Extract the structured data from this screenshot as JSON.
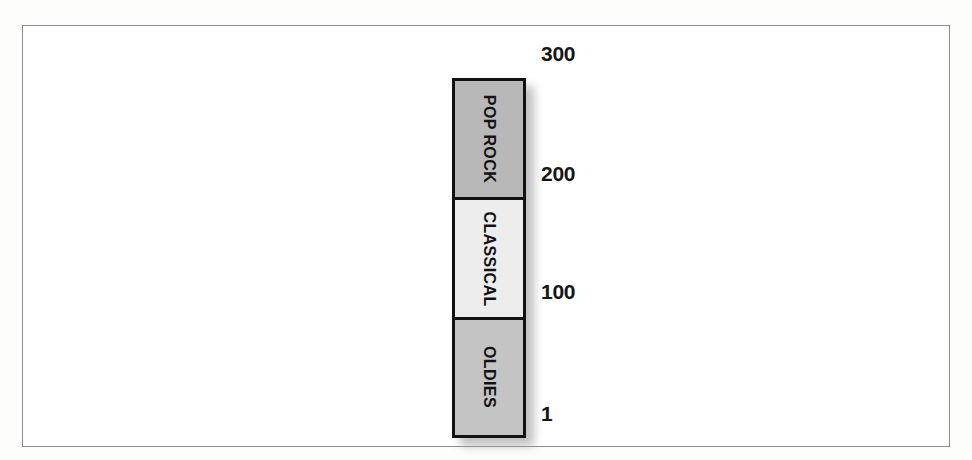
{
  "chart_data": {
    "type": "bar",
    "orientation": "vertical",
    "stacked": true,
    "title": "",
    "subtitle": "",
    "xlabel": "",
    "ylabel": "",
    "grid": false,
    "legend_position": "none",
    "axis": {
      "ticks": [
        {
          "label": "300",
          "value": 300,
          "y_px": 52
        },
        {
          "label": "200",
          "value": 200,
          "y_px": 172
        },
        {
          "label": "100",
          "value": 100,
          "y_px": 290
        },
        {
          "label": "1",
          "value": 1,
          "y_px": 412
        }
      ],
      "ylim": [
        1,
        300
      ]
    },
    "categories": [
      "OLDIES",
      "CLASSICAL",
      "POP ROCK"
    ],
    "values": [
      99,
      100,
      100
    ],
    "segments": [
      {
        "label": "POP ROCK",
        "range_start": 200,
        "range_end": 300,
        "value": 100,
        "fill": "#b8b8b8",
        "order_from_top": 1
      },
      {
        "label": "CLASSICAL",
        "range_start": 100,
        "range_end": 200,
        "value": 100,
        "fill": "#ededed",
        "order_from_top": 2
      },
      {
        "label": "OLDIES",
        "range_start": 1,
        "range_end": 100,
        "value": 99,
        "fill": "#c4c4c4",
        "order_from_top": 3
      }
    ]
  },
  "style": {
    "page_background": "#fdfdfc",
    "frame_background": "#ffffff",
    "frame_border_color": "#8d8d8d",
    "bar_border_color": "#111111",
    "text_color": "#131313",
    "shadow_color": "#9a9a9a"
  }
}
